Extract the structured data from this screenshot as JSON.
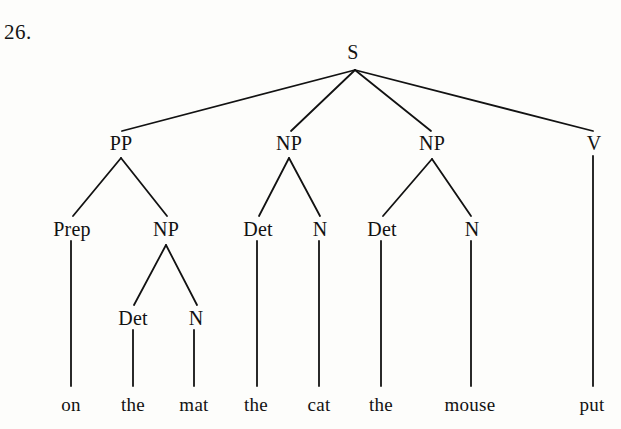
{
  "figure": {
    "item_number": "26.",
    "type": "constituency-syntax-tree",
    "ink_color": "#121212",
    "background_color": "#fdfdfb",
    "width": 621,
    "height": 429
  },
  "nodes": {
    "s": {
      "label": "S",
      "x": 353,
      "y": 52
    },
    "pp": {
      "label": "PP",
      "x": 121,
      "y": 143
    },
    "np_subject": {
      "label": "NP",
      "x": 289,
      "y": 143
    },
    "np_object": {
      "label": "NP",
      "x": 432,
      "y": 143
    },
    "v": {
      "label": "V",
      "x": 594,
      "y": 143
    },
    "prep": {
      "label": "Prep",
      "x": 72,
      "y": 229
    },
    "np_in_pp": {
      "label": "NP",
      "x": 166,
      "y": 229
    },
    "det_subject": {
      "label": "Det",
      "x": 258,
      "y": 229
    },
    "n_subject": {
      "label": "N",
      "x": 320,
      "y": 229
    },
    "det_object": {
      "label": "Det",
      "x": 382,
      "y": 229
    },
    "n_object": {
      "label": "N",
      "x": 472,
      "y": 229
    },
    "det_in_pp": {
      "label": "Det",
      "x": 133,
      "y": 318
    },
    "n_in_pp": {
      "label": "N",
      "x": 196,
      "y": 318
    }
  },
  "leaves": [
    {
      "word": "on",
      "x": 71,
      "y": 404
    },
    {
      "word": "the",
      "x": 133,
      "y": 404
    },
    {
      "word": "mat",
      "x": 194,
      "y": 404
    },
    {
      "word": "the",
      "x": 256,
      "y": 404
    },
    {
      "word": "cat",
      "x": 319,
      "y": 404
    },
    {
      "word": "the",
      "x": 381,
      "y": 404
    },
    {
      "word": "mouse",
      "x": 470,
      "y": 404
    },
    {
      "word": "put",
      "x": 592,
      "y": 404
    }
  ],
  "sentence": "on the mat the cat the mouse put"
}
